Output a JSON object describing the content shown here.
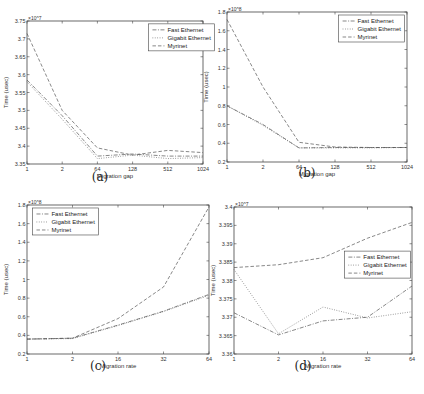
{
  "chart_data": [
    {
      "id": "a",
      "type": "line",
      "caption": "(a)",
      "title": "",
      "xlabel": "Migration gap",
      "ylabel": "Time (usec)",
      "y_multiplier": "x10^7",
      "categories": [
        "1",
        "2",
        "64",
        "128",
        "512",
        "1024"
      ],
      "ylim": [
        3.35,
        3.75
      ],
      "yticks": [
        "3.35",
        "3.4",
        "3.45",
        "3.5",
        "3.55",
        "3.6",
        "3.65",
        "3.7",
        "3.75"
      ],
      "legend_position": "upper right",
      "series": [
        {
          "name": "Fast Ethernet",
          "style": "dashdot",
          "values": [
            3.585,
            3.485,
            3.372,
            3.378,
            3.372,
            3.372
          ]
        },
        {
          "name": "Gigabit Ethernet",
          "style": "dotted",
          "values": [
            3.58,
            3.475,
            3.365,
            3.375,
            3.365,
            3.368
          ]
        },
        {
          "name": "Myrinet",
          "style": "dashed",
          "values": [
            3.715,
            3.5,
            3.395,
            3.375,
            3.388,
            3.382
          ]
        }
      ]
    },
    {
      "id": "b",
      "type": "line",
      "caption": "(b)",
      "title": "",
      "xlabel": "Migration gap",
      "ylabel": "Time (usec)",
      "y_multiplier": "x10^8",
      "categories": [
        "1",
        "2",
        "64",
        "128",
        "512",
        "1024"
      ],
      "ylim": [
        0.2,
        1.8
      ],
      "yticks": [
        "0.2",
        "0.4",
        "0.6",
        "0.8",
        "1",
        "1.2",
        "1.4",
        "1.6",
        "1.8"
      ],
      "legend_position": "upper right",
      "series": [
        {
          "name": "Fast Ethernet",
          "style": "dashdot",
          "values": [
            0.8,
            0.6,
            0.35,
            0.355,
            0.355,
            0.355
          ]
        },
        {
          "name": "Gigabit Ethernet",
          "style": "dotted",
          "values": [
            0.8,
            0.59,
            0.35,
            0.35,
            0.35,
            0.355
          ]
        },
        {
          "name": "Myrinet",
          "style": "dashed",
          "values": [
            1.72,
            1.0,
            0.41,
            0.36,
            0.355,
            0.355
          ]
        }
      ]
    },
    {
      "id": "c",
      "type": "line",
      "caption": "(c)",
      "title": "",
      "xlabel": "Migration rate",
      "ylabel": "Time (usec)",
      "y_multiplier": "x10^8",
      "categories": [
        "1",
        "2",
        "16",
        "32",
        "64"
      ],
      "ylim": [
        0.2,
        1.8
      ],
      "yticks": [
        "0.2",
        "0.4",
        "0.6",
        "0.8",
        "1",
        "1.2",
        "1.4",
        "1.6",
        "1.8"
      ],
      "legend_position": "upper left",
      "series": [
        {
          "name": "Fast Ethernet",
          "style": "dashdot",
          "values": [
            0.36,
            0.37,
            0.51,
            0.66,
            0.84
          ]
        },
        {
          "name": "Gigabit Ethernet",
          "style": "dotted",
          "values": [
            0.36,
            0.365,
            0.505,
            0.655,
            0.83
          ]
        },
        {
          "name": "Myrinet",
          "style": "dashed",
          "values": [
            0.36,
            0.37,
            0.58,
            0.92,
            1.78
          ]
        }
      ]
    },
    {
      "id": "d",
      "type": "line",
      "caption": "(d)",
      "title": "",
      "xlabel": "Migration rate",
      "ylabel": "Time (usec)",
      "y_multiplier": "x10^7",
      "categories": [
        "1",
        "2",
        "16",
        "32",
        "64"
      ],
      "ylim": [
        3.36,
        3.4
      ],
      "yticks": [
        "3.36",
        "3.365",
        "3.37",
        "3.375",
        "3.38",
        "3.385",
        "3.39",
        "3.395",
        "3.4"
      ],
      "legend_position": "center right",
      "series": [
        {
          "name": "Fast Ethernet",
          "style": "dashdot",
          "values": [
            3.3712,
            3.3652,
            3.369,
            3.37,
            3.3785
          ]
        },
        {
          "name": "Gigabit Ethernet",
          "style": "dotted",
          "values": [
            3.383,
            3.3655,
            3.3728,
            3.3698,
            3.3715
          ]
        },
        {
          "name": "Myrinet",
          "style": "dashed",
          "values": [
            3.3835,
            3.3843,
            3.3862,
            3.3915,
            3.3958
          ]
        }
      ]
    }
  ],
  "layout": {
    "panels": [
      {
        "id": "a",
        "left": 27,
        "top": 21,
        "width": 176,
        "height": 143,
        "legend_x": 0.69,
        "legend_y": 0.02,
        "caption_x": 100,
        "caption_y": 177
      },
      {
        "id": "b",
        "left": 227,
        "top": 12,
        "width": 180,
        "height": 150,
        "legend_x": 0.62,
        "legend_y": 0.02,
        "caption_x": 307,
        "caption_y": 173
      },
      {
        "id": "c",
        "left": 27,
        "top": 205,
        "width": 182,
        "height": 149,
        "legend_x": 0.03,
        "legend_y": 0.02,
        "caption_x": 98,
        "caption_y": 366
      },
      {
        "id": "d",
        "left": 234,
        "top": 207,
        "width": 178,
        "height": 147,
        "legend_x": 0.62,
        "legend_y": 0.3,
        "caption_x": 303,
        "caption_y": 366
      }
    ],
    "line_color": "#555555",
    "axis_color": "#444444"
  }
}
